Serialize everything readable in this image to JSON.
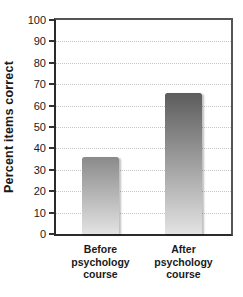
{
  "figure": {
    "background_color": "#ffffff",
    "text_color": "#1a1a1a"
  },
  "chart_data": {
    "type": "bar",
    "title": "",
    "categories": [
      "Before psychology course",
      "After psychology course"
    ],
    "values": [
      36,
      66
    ],
    "xlabel": "",
    "ylabel": "Percent items correct",
    "ylim": [
      0,
      100
    ],
    "ytick_step": 10,
    "ytick_labels": [
      "0",
      "10",
      "20",
      "30",
      "40",
      "50",
      "60",
      "70",
      "80",
      "90",
      "100"
    ],
    "grid": "horizontal-dotted",
    "legend": "none",
    "plot_border": "full-box",
    "bar_style": {
      "gradient_top_colors": [
        "#8a8a8a",
        "#5c5c5c"
      ],
      "gradient_bottom_color": "#e3e3e3",
      "gridline_color": "#c6c6c6",
      "shadow": true
    }
  }
}
